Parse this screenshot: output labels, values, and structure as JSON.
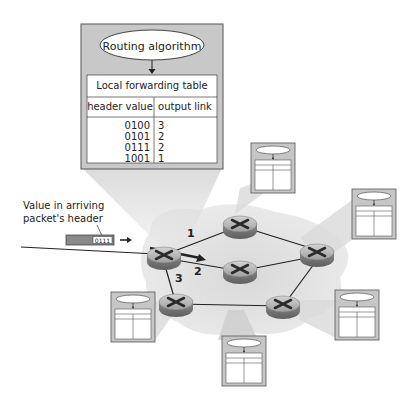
{
  "figure": {
    "routing_algorithm_label": "Routing algorithm",
    "table_title": "Local forwarding table",
    "columns": [
      "header value",
      "output link"
    ],
    "rows": [
      {
        "header": "0100",
        "link": "3"
      },
      {
        "header": "0101",
        "link": "2"
      },
      {
        "header": "0111",
        "link": "2"
      },
      {
        "header": "1001",
        "link": "1"
      }
    ],
    "packet_label_line1": "Value in arriving",
    "packet_label_line2": "packet's header",
    "packet_header_value": "0111",
    "link_labels": [
      "1",
      "2",
      "3"
    ]
  },
  "colors": {
    "box_fill": "#c8c8c8",
    "cloud_fill": "#e2e2e2",
    "funnel_fill": "#d6d6d6",
    "packet_fill": "#8a8a8a",
    "router_fill": "#b4b4b4",
    "line": "#222222"
  },
  "icons": [
    "router-icon",
    "forwarding-table-icon",
    "arrow-right-icon"
  ]
}
